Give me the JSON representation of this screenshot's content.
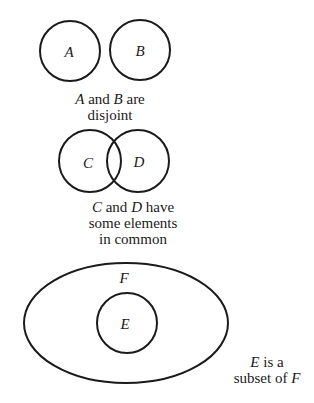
{
  "diagrams": {
    "disjoint": {
      "sets": [
        {
          "label": "A",
          "cx": 70,
          "cy": 51,
          "r": 30
        },
        {
          "label": "B",
          "cx": 140,
          "cy": 50,
          "r": 30
        }
      ],
      "caption": {
        "line1_var1": "A",
        "line1_mid": " and ",
        "line1_var2": "B",
        "line1_end": " are",
        "line2": "disjoint"
      }
    },
    "overlap": {
      "sets": [
        {
          "label": "C",
          "cx": 90,
          "cy": 161,
          "r": 31
        },
        {
          "label": "D",
          "cx": 138,
          "cy": 161,
          "r": 31
        }
      ],
      "caption": {
        "line1_var1": "C",
        "line1_mid": " and ",
        "line1_var2": "D",
        "line1_end": " have",
        "line2": "some elements",
        "line3": "in common"
      }
    },
    "subset": {
      "outer": {
        "label": "F",
        "cx": 126,
        "cy": 323,
        "rx": 102,
        "ry": 60
      },
      "inner": {
        "label": "E",
        "cx": 127,
        "cy": 323,
        "r": 30
      },
      "caption": {
        "line1_var": "E",
        "line1_end": " is a",
        "line2_start": "subset of ",
        "line2_var": "F"
      }
    }
  },
  "colors": {
    "stroke": "#1a1a1a",
    "background": "#ffffff"
  }
}
